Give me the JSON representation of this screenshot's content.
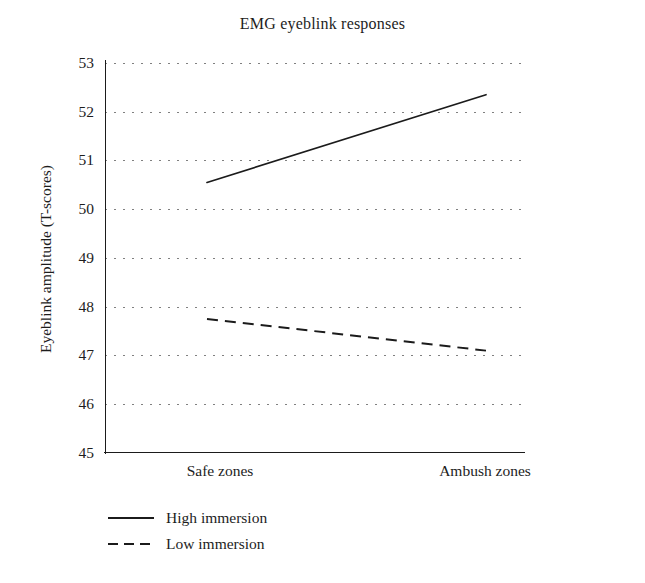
{
  "chart_data": {
    "type": "line",
    "title": "EMG eyeblink responses",
    "xlabel": "",
    "ylabel": "Eyeblink amplitude (T-scores)",
    "categories": [
      "Safe zones",
      "Ambush zones"
    ],
    "series": [
      {
        "name": "High immersion",
        "style": "solid",
        "values": [
          50.55,
          52.35
        ]
      },
      {
        "name": "Low immersion",
        "style": "dashed",
        "values": [
          47.75,
          47.1
        ]
      }
    ],
    "ylim": [
      45,
      53
    ],
    "yticks": [
      "53",
      "52",
      "51",
      "50",
      "49",
      "48",
      "47",
      "46",
      "45"
    ],
    "grid": "horizontal-dotted",
    "legend_position": "below-left",
    "line_color": "#1b1b1b"
  },
  "legend": {
    "items": [
      {
        "label": "High immersion",
        "style": "solid"
      },
      {
        "label": "Low immersion",
        "style": "dashed"
      }
    ]
  }
}
